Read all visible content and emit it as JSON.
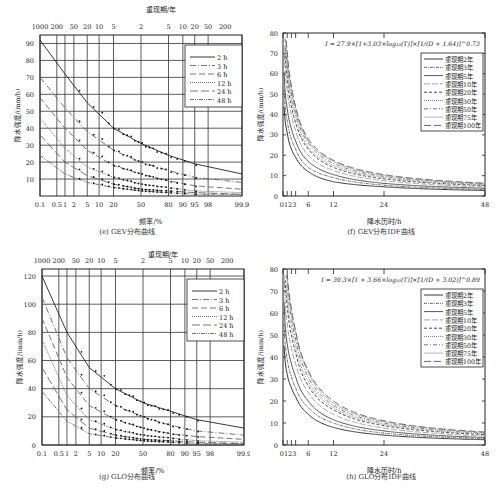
{
  "panels": {
    "e": {
      "caption": "(e) GEV分布曲线",
      "top_axis_label": "重现期/年",
      "xlabel": "频率/%",
      "ylabel": "降水强度/(mm/h)"
    },
    "f": {
      "caption": "(f) GEV分布IDF曲线",
      "xlabel": "降水历时/h",
      "ylabel": "降水强度/(mm/h)",
      "formula": "I = 27.9×[1+3.03×log₁₀(T)]×[1/(D + 1.64)]^0.73"
    },
    "g": {
      "caption": "(g) GLO分布曲线",
      "top_axis_label": "重现期/年",
      "xlabel": "频率/%",
      "ylabel": "降水强度/(mm/h)"
    },
    "h": {
      "caption": "(h) GLO分布IDF曲线",
      "xlabel": "降水历时/h",
      "ylabel": "降水强度/(mm/h)",
      "formula": "I = 39.3×[1 + 3.66×log₁₀(T)]×[1/(D + 3.02)]^0.89"
    }
  },
  "chart_data": [
    {
      "id": "e",
      "type": "line",
      "title": "(e) GEV分布曲线",
      "xlabel": "频率/%",
      "ylabel": "降水强度/(mm/h)",
      "x_ticks": [
        "0.1",
        "0.5",
        "1",
        "2",
        "5",
        "10",
        "20",
        "50",
        "80",
        "90",
        "95",
        "98",
        "99.9"
      ],
      "top_axis_label": "重现期/年",
      "top_ticks": [
        "1000",
        "200",
        "50",
        "20",
        "10",
        "5",
        "2",
        "5",
        "10",
        "20",
        "50",
        "200"
      ],
      "y_ticks": [
        10,
        20,
        30,
        40,
        50,
        60,
        70,
        80,
        90
      ],
      "ylim": [
        0,
        95
      ],
      "grid": true,
      "legend_position": "upper right",
      "legend": [
        "2 h",
        "3 h",
        "6 h",
        "12 h",
        "24 h",
        "48 h"
      ],
      "series": [
        {
          "name": "2 h",
          "x": [
            0.1,
            1,
            5,
            20,
            50,
            80,
            95,
            99.9
          ],
          "values": [
            92,
            72,
            55,
            40,
            31,
            24,
            19,
            13
          ]
        },
        {
          "name": "3 h",
          "x": [
            0.1,
            1,
            5,
            20,
            50,
            80,
            95,
            99.9
          ],
          "values": [
            70,
            52,
            38,
            27,
            20,
            15,
            11,
            8
          ]
        },
        {
          "name": "6 h",
          "x": [
            0.1,
            1,
            5,
            20,
            50,
            80,
            95,
            99.9
          ],
          "values": [
            58,
            40,
            27,
            18,
            13,
            9,
            6,
            4
          ]
        },
        {
          "name": "12 h",
          "x": [
            0.1,
            1,
            5,
            20,
            50,
            80,
            95,
            99.9
          ],
          "values": [
            46,
            28,
            17,
            11,
            7,
            5,
            3,
            2
          ]
        },
        {
          "name": "24 h",
          "x": [
            0.1,
            1,
            5,
            20,
            50,
            80,
            95,
            99.9
          ],
          "values": [
            36,
            20,
            12,
            7,
            4,
            3,
            2,
            1
          ]
        },
        {
          "name": "48 h",
          "x": [
            0.1,
            1,
            5,
            20,
            50,
            80,
            95,
            99.9
          ],
          "values": [
            24,
            13,
            8,
            5,
            3,
            2,
            1,
            1
          ]
        }
      ]
    },
    {
      "id": "f",
      "type": "line",
      "title": "(f) GEV分布IDF曲线",
      "xlabel": "降水历时/h",
      "ylabel": "降水强度/(mm/h)",
      "annotation": "I = 27.9×[1+3.03×log₁₀(T)]×[1/(D + 1.64)]^0.73",
      "x_ticks": [
        0,
        1,
        2,
        3,
        6,
        12,
        24,
        48
      ],
      "y_ticks": [
        0,
        10,
        20,
        30,
        40,
        50,
        60,
        70,
        80
      ],
      "ylim": [
        0,
        80
      ],
      "xlim": [
        0,
        48
      ],
      "legend_position": "upper right",
      "legend": [
        "重现期2年",
        "重现期3年",
        "重现期5年",
        "重现期10年",
        "重现期20年",
        "重现期30年",
        "重现期50年",
        "重现期75年",
        "重现期100年"
      ],
      "x": [
        1,
        2,
        3,
        6,
        12,
        24,
        48
      ],
      "series": [
        {
          "name": "重现期2年",
          "values": [
            31,
            23,
            19,
            12,
            7,
            4.5,
            2.7
          ]
        },
        {
          "name": "重现期3年",
          "values": [
            37,
            28,
            23,
            14,
            9,
            5.3,
            3.2
          ]
        },
        {
          "name": "重现期5年",
          "values": [
            43,
            33,
            27,
            17,
            10.5,
            6.2,
            3.8
          ]
        },
        {
          "name": "重现期10年",
          "values": [
            52,
            40,
            32,
            20,
            12.5,
            7.5,
            4.5
          ]
        },
        {
          "name": "重现期20年",
          "values": [
            58,
            44,
            36,
            23,
            14,
            8.4,
            5.1
          ]
        },
        {
          "name": "重现期30年",
          "values": [
            62,
            47,
            39,
            24,
            15,
            9,
            5.4
          ]
        },
        {
          "name": "重现期50年",
          "values": [
            65,
            50,
            41,
            26,
            16,
            9.6,
            5.8
          ]
        },
        {
          "name": "重现期75年",
          "values": [
            68,
            52,
            43,
            27,
            17,
            10,
            6.1
          ]
        },
        {
          "name": "重现期100年",
          "values": [
            71,
            54,
            44,
            28,
            17.5,
            10.5,
            6.3
          ]
        }
      ]
    },
    {
      "id": "g",
      "type": "line",
      "title": "(g) GLO分布曲线",
      "xlabel": "频率/%",
      "ylabel": "降水强度/(mm/h)",
      "x_ticks": [
        "0.1",
        "0.5",
        "1",
        "2",
        "5",
        "10",
        "20",
        "50",
        "80",
        "90",
        "95",
        "98",
        "99.9"
      ],
      "top_axis_label": "重现期/年",
      "top_ticks": [
        "1000",
        "200",
        "50",
        "20",
        "10",
        "5",
        "2",
        "5",
        "10",
        "20",
        "50",
        "200"
      ],
      "y_ticks": [
        0,
        20,
        40,
        60,
        80,
        100,
        120
      ],
      "ylim": [
        0,
        125
      ],
      "grid": true,
      "legend_position": "upper right",
      "legend": [
        "2 h",
        "3 h",
        "6 h",
        "12 h",
        "24 h",
        "48 h"
      ],
      "series": [
        {
          "name": "2 h",
          "x": [
            0.1,
            1,
            5,
            20,
            50,
            80,
            95,
            99.9
          ],
          "values": [
            120,
            80,
            55,
            40,
            30,
            24,
            18,
            12
          ]
        },
        {
          "name": "3 h",
          "x": [
            0.1,
            1,
            5,
            20,
            50,
            80,
            95,
            99.9
          ],
          "values": [
            105,
            62,
            40,
            28,
            20,
            14,
            10,
            7
          ]
        },
        {
          "name": "6 h",
          "x": [
            0.1,
            1,
            5,
            20,
            50,
            80,
            95,
            99.9
          ],
          "values": [
            90,
            48,
            28,
            18,
            12,
            8,
            6,
            4
          ]
        },
        {
          "name": "12 h",
          "x": [
            0.1,
            1,
            5,
            20,
            50,
            80,
            95,
            99.9
          ],
          "values": [
            75,
            35,
            18,
            11,
            7,
            5,
            3,
            2
          ]
        },
        {
          "name": "24 h",
          "x": [
            0.1,
            1,
            5,
            20,
            50,
            80,
            95,
            99.9
          ],
          "values": [
            55,
            25,
            12,
            7,
            4,
            3,
            2,
            1
          ]
        },
        {
          "name": "48 h",
          "x": [
            0.1,
            1,
            5,
            20,
            50,
            80,
            95,
            99.9
          ],
          "values": [
            38,
            17,
            8,
            5,
            3,
            2,
            1,
            1
          ]
        }
      ]
    },
    {
      "id": "h",
      "type": "line",
      "title": "(h) GLO分布IDF曲线",
      "xlabel": "降水历时/h",
      "ylabel": "降水强度/(mm/h)",
      "annotation": "I = 39.3×[1 + 3.66×log₁₀(T)]×[1/(D + 3.02)]^0.89",
      "x_ticks": [
        0,
        1,
        2,
        3,
        6,
        12,
        24,
        48
      ],
      "y_ticks": [
        0,
        10,
        20,
        30,
        40,
        50,
        60,
        70,
        80
      ],
      "ylim": [
        0,
        80
      ],
      "xlim": [
        0,
        48
      ],
      "legend_position": "upper right",
      "legend": [
        "重现期2年",
        "重现期3年",
        "重现期5年",
        "重现期10年",
        "重现期20年",
        "重现期30年",
        "重现期50年",
        "重现期75年",
        "重现期100年"
      ],
      "x": [
        1,
        2,
        3,
        6,
        12,
        24,
        48
      ],
      "series": [
        {
          "name": "重现期2年",
          "values": [
            32,
            26,
            22,
            14,
            8,
            4.5,
            2.4
          ]
        },
        {
          "name": "重现期3年",
          "values": [
            39,
            31,
            26,
            17,
            10,
            5.4,
            2.9
          ]
        },
        {
          "name": "重现期5年",
          "values": [
            46,
            37,
            31,
            20,
            11.5,
            6.4,
            3.4
          ]
        },
        {
          "name": "重现期10年",
          "values": [
            55,
            44,
            37,
            24,
            14,
            7.7,
            4.1
          ]
        },
        {
          "name": "重现期20年",
          "values": [
            63,
            50,
            42,
            27,
            16,
            8.8,
            4.7
          ]
        },
        {
          "name": "重现期30年",
          "values": [
            67,
            54,
            45,
            29,
            17,
            9.4,
            5
          ]
        },
        {
          "name": "重现期50年",
          "values": [
            72,
            58,
            48,
            31,
            18,
            10,
            5.4
          ]
        },
        {
          "name": "重现期75年",
          "values": [
            75,
            60,
            51,
            33,
            19,
            10.6,
            5.7
          ]
        },
        {
          "name": "重现期100年",
          "values": [
            78,
            62,
            52,
            34,
            20,
            11,
            5.9
          ]
        }
      ]
    }
  ]
}
